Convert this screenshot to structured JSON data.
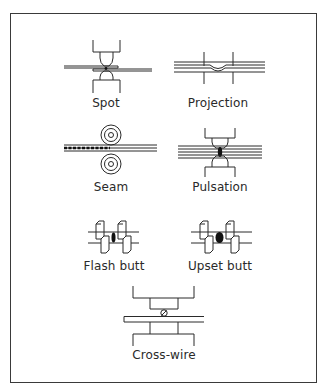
{
  "figure": {
    "title": "",
    "stroke_color": "#2a2a2a",
    "panels": [
      {
        "id": "spot",
        "label": "Spot"
      },
      {
        "id": "projection",
        "label": "Projection"
      },
      {
        "id": "seam",
        "label": "Seam"
      },
      {
        "id": "pulsation",
        "label": "Pulsation"
      },
      {
        "id": "flash-butt",
        "label": "Flash butt"
      },
      {
        "id": "upset-butt",
        "label": "Upset butt"
      },
      {
        "id": "cross-wire",
        "label": "Cross-wire"
      }
    ]
  }
}
